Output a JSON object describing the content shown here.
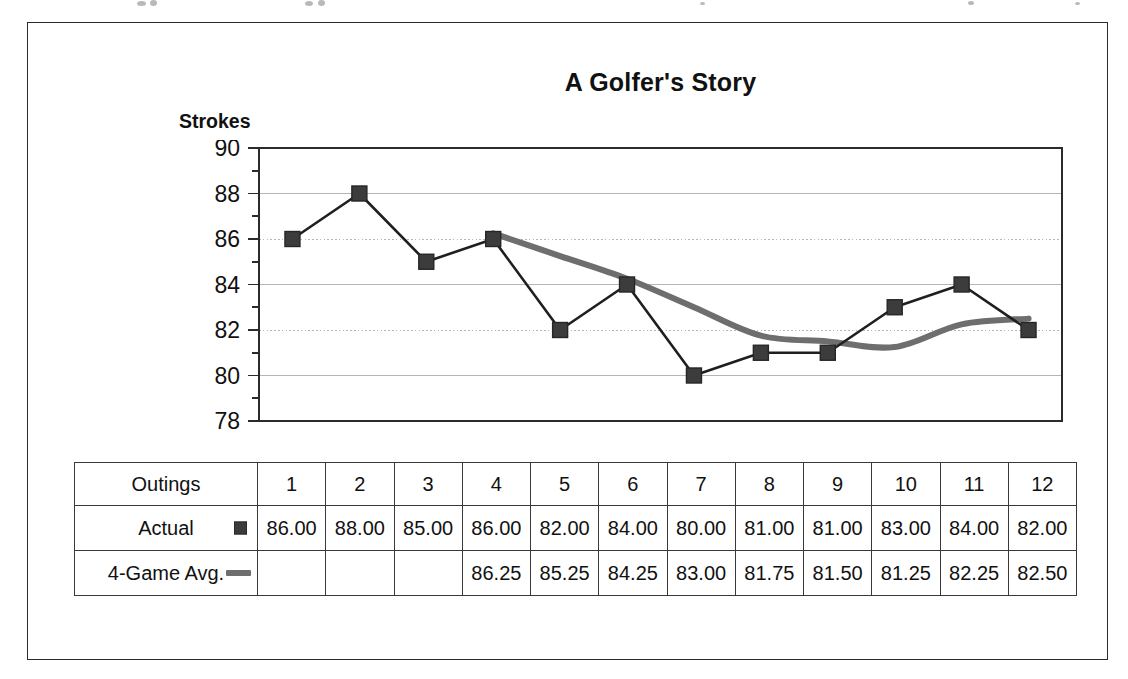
{
  "figure": {
    "title": "A Golfer's Story",
    "y_axis_title": "Strokes"
  },
  "chart_data": {
    "type": "line",
    "title": "A Golfer's Story",
    "xlabel": "Outings",
    "ylabel": "Strokes",
    "ylim": [
      78,
      90
    ],
    "y_ticks": [
      78,
      80,
      82,
      84,
      86,
      88,
      90
    ],
    "y_minor_tick_step": 1,
    "grid": true,
    "legend_position": "table-row-labels",
    "categories": [
      "1",
      "2",
      "3",
      "4",
      "5",
      "6",
      "7",
      "8",
      "9",
      "10",
      "11",
      "12"
    ],
    "series": [
      {
        "name": "Actual",
        "marker": "square",
        "color": "#3c3c3c",
        "line_color": "#1f1f1f",
        "values": [
          86.0,
          88.0,
          85.0,
          86.0,
          82.0,
          84.0,
          80.0,
          81.0,
          81.0,
          83.0,
          84.0,
          82.0
        ],
        "labels": [
          "86.00",
          "88.00",
          "85.00",
          "86.00",
          "82.00",
          "84.00",
          "80.00",
          "81.00",
          "81.00",
          "83.00",
          "84.00",
          "82.00"
        ]
      },
      {
        "name": "4-Game Avg.",
        "marker": "none",
        "color": "#6e6e6e",
        "line_color": "#6e6e6e",
        "smooth": true,
        "values": [
          null,
          null,
          null,
          86.25,
          85.25,
          84.25,
          83.0,
          81.75,
          81.5,
          81.25,
          82.25,
          82.5
        ],
        "labels": [
          "",
          "",
          "",
          "86.25",
          "85.25",
          "84.25",
          "83.00",
          "81.75",
          "81.50",
          "81.25",
          "82.25",
          "82.50"
        ]
      }
    ]
  },
  "table": {
    "corner_label": "Outings",
    "columns": [
      "1",
      "2",
      "3",
      "4",
      "5",
      "6",
      "7",
      "8",
      "9",
      "10",
      "11",
      "12"
    ],
    "rows": [
      {
        "label": "Actual",
        "swatch": "square-marker-icon",
        "cells": [
          "86.00",
          "88.00",
          "85.00",
          "86.00",
          "82.00",
          "84.00",
          "80.00",
          "81.00",
          "81.00",
          "83.00",
          "84.00",
          "82.00"
        ]
      },
      {
        "label": "4-Game Avg.",
        "swatch": "line-marker-icon",
        "cells": [
          "",
          "",
          "",
          "86.25",
          "85.25",
          "84.25",
          "83.00",
          "81.75",
          "81.50",
          "81.25",
          "82.25",
          "82.50"
        ]
      }
    ]
  },
  "colors": {
    "actual_marker": "#3c3c3c",
    "actual_line": "#1f1f1f",
    "average_line": "#6e6e6e",
    "axis": "#2b2b2b",
    "gridline": "#b5b5b5",
    "frame": "#2b2b2b"
  }
}
